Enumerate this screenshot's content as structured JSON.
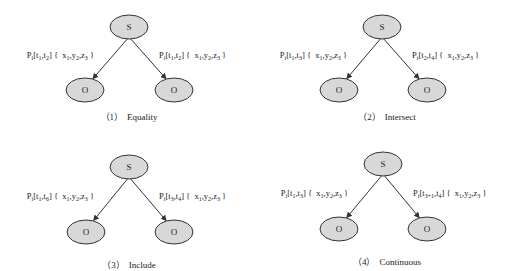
{
  "diagram": {
    "node_fill": "#d8d8d8",
    "node_stroke": "#333333",
    "edge_color": "#333333",
    "panels": [
      {
        "id": 1,
        "caption_num": "（1）",
        "caption": "Equality",
        "subject": "S",
        "left_object": "O",
        "right_object": "O",
        "left_label": {
          "p": "P",
          "ps": "i",
          "t_a": "t",
          "t_a_sub": "1",
          "t_b": "t",
          "t_b_sub": "2",
          "x_sub": "1",
          "y_sub": "2",
          "z_sub": "3"
        },
        "right_label": {
          "p": "P",
          "ps": "i",
          "t_a": "t",
          "t_a_sub": "1",
          "t_b": "t",
          "t_b_sub": "2",
          "x_sub": "1",
          "y_sub": "2",
          "z_sub": "3"
        }
      },
      {
        "id": 2,
        "caption_num": "（2）",
        "caption": "Intersect",
        "subject": "S",
        "left_object": "O",
        "right_object": "O",
        "left_label": {
          "p": "P",
          "ps": "i",
          "t_a": "t",
          "t_a_sub": "1",
          "t_b": "t",
          "t_b_sub": "3",
          "x_sub": "1",
          "y_sub": "2",
          "z_sub": "3"
        },
        "right_label": {
          "p": "P",
          "ps": "i",
          "t_a": "t",
          "t_a_sub": "2",
          "t_b": "t",
          "t_b_sub": "4",
          "x_sub": "1",
          "y_sub": "2",
          "z_sub": "3"
        }
      },
      {
        "id": 3,
        "caption_num": "（3）",
        "caption": "Include",
        "subject": "S",
        "left_object": "O",
        "right_object": "O",
        "left_label": {
          "p": "P",
          "ps": "i",
          "t_a": "t",
          "t_a_sub": "1",
          "t_b": "t",
          "t_b_sub": "6",
          "x_sub": "1",
          "y_sub": "2",
          "z_sub": "3"
        },
        "right_label": {
          "p": "P",
          "ps": "i",
          "t_a": "t",
          "t_a_sub": "3",
          "t_b": "t",
          "t_b_sub": "4",
          "x_sub": "1",
          "y_sub": "2",
          "z_sub": "3"
        }
      },
      {
        "id": 4,
        "caption_num": "（4）",
        "caption": "Continuous",
        "subject": "S",
        "left_object": "O",
        "right_object": "O",
        "left_label": {
          "p": "P",
          "ps": "i",
          "t_a": "t",
          "t_a_sub": "1",
          "t_b": "t",
          "t_b_sub": "3",
          "x_sub": "1",
          "y_sub": "2",
          "z_sub": "3"
        },
        "right_label": {
          "p": "P",
          "ps": "i",
          "t_a": "t",
          "t_a_sub": "3+1",
          "t_b": "t",
          "t_b_sub": "4",
          "x_sub": "1",
          "y_sub": "2",
          "z_sub": "3"
        }
      }
    ]
  }
}
